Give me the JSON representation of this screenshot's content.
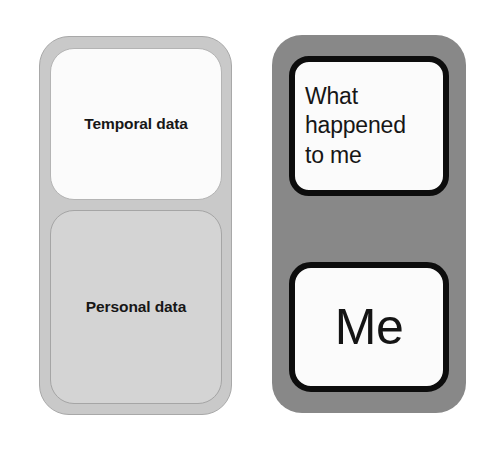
{
  "diagram": {
    "colors": {
      "page_background": "#ffffff",
      "left_group_fill": "#c9c9c9",
      "left_group_border": "#a8a8a8",
      "temporal_box_fill": "#fbfbfb",
      "personal_box_fill": "#d4d4d4",
      "right_group_fill": "#888888",
      "right_box_fill": "#fbfbfb",
      "right_box_border": "#0d0d0d",
      "text_color": "#161616"
    },
    "left_group": {
      "name": "technical-terms-group",
      "boxes": [
        {
          "id": "temporal-data",
          "label": "Temporal data"
        },
        {
          "id": "personal-data",
          "label": "Personal data"
        }
      ]
    },
    "right_group": {
      "name": "plain-language-group",
      "boxes": [
        {
          "id": "what-happened-to-me",
          "lines": [
            "What",
            "happened",
            "to me"
          ]
        },
        {
          "id": "me",
          "label": "Me"
        }
      ]
    }
  }
}
